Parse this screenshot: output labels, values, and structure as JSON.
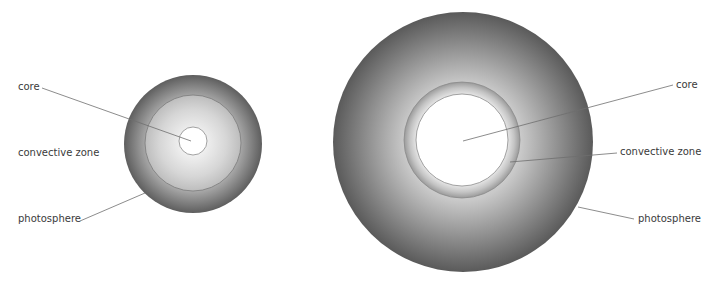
{
  "diagram": {
    "colors": {
      "photosphere_edge": "#5a5a5a",
      "photosphere_mid": "#a8a8a8",
      "core_fill": "#ffffff",
      "leader_line": "#6e6e6e",
      "label_text": "#3a3a3a"
    },
    "small_star": {
      "labels": {
        "core": "core",
        "convective_zone": "convective zone",
        "photosphere": "photosphere"
      }
    },
    "large_star": {
      "labels": {
        "core": "core",
        "convective_zone": "convective zone",
        "photosphere": "photosphere"
      }
    }
  }
}
